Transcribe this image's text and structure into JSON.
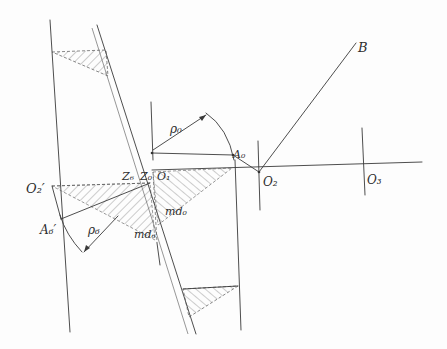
{
  "diagram": {
    "type": "hand-drawn geometric construction (cam / linkage layout)",
    "labels": {
      "B": "B",
      "A0": "A₀",
      "O1": "O₁",
      "O2": "O₂",
      "O3": "O₃",
      "O2_prime": "O₂′",
      "A6_prime": "A₆′",
      "Z6": "Z₆",
      "Z0": "Z₀",
      "rho0": "ρ₀",
      "rho6": "ρ₆",
      "md0": "md₀",
      "md6": "md₆"
    },
    "points": {
      "O1": [
        152,
        153
      ],
      "O2": [
        259,
        172
      ],
      "O3": [
        364,
        164
      ],
      "B": [
        356,
        43
      ],
      "A0": [
        233,
        155
      ],
      "O2_prime": [
        52,
        186
      ],
      "A6_prime": [
        61,
        219
      ]
    },
    "colors": {
      "ink": "#3a3a3a",
      "paper": "#fdfdfd"
    }
  }
}
